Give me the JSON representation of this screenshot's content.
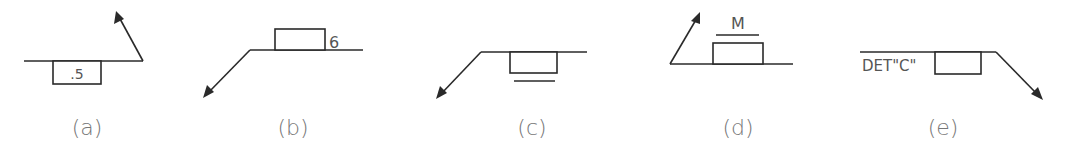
{
  "figure": {
    "background": "#ffffff",
    "line_color": "#2a2a2a",
    "panels": [
      {
        "id": "a",
        "caption": "(a)",
        "box_text": ".5",
        "box_side": "below",
        "arrow_direction": "up-left from right end"
      },
      {
        "id": "b",
        "caption": "(b)",
        "box_text": "",
        "side_text": "6",
        "box_side": "above",
        "arrow_direction": "down-left from left end"
      },
      {
        "id": "c",
        "caption": "(c)",
        "box_text": "",
        "box_side": "below",
        "underline": true,
        "arrow_direction": "down-left from left end"
      },
      {
        "id": "d",
        "caption": "(d)",
        "box_text": "",
        "top_text": "M",
        "overline": true,
        "box_side": "above",
        "arrow_direction": "up-right from left end"
      },
      {
        "id": "e",
        "caption": "(e)",
        "box_text": "",
        "side_text": "DET\"C\"",
        "box_side": "below",
        "arrow_direction": "down-right from right end"
      }
    ]
  }
}
